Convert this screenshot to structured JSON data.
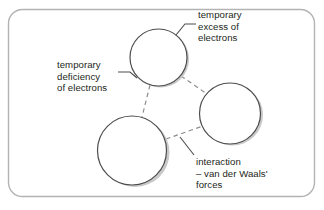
{
  "figure": {
    "frame": {
      "border_color": "#b3b3b3",
      "fill_color": "#ffffff",
      "corner_radius": 14
    },
    "colors": {
      "circle_outline": "#4d4d4d",
      "circle_shading": "#c9c9c9",
      "circle_fill": "#ffffff",
      "dashed_line": "#8c8c8c",
      "leader_line": "#4d4d4d",
      "text": "#231f20"
    },
    "atoms": [
      {
        "name": "top-atom",
        "cx": 159,
        "cy": 58,
        "r": 29
      },
      {
        "name": "bottom-left-atom",
        "cx": 133,
        "cy": 151,
        "r": 35
      },
      {
        "name": "right-atom",
        "cx": 231,
        "cy": 114,
        "r": 31
      }
    ],
    "labels": {
      "excess": {
        "name": "temporary-excess-of-electrons",
        "lines": [
          "temporary",
          "excess of",
          "electrons"
        ],
        "line1": "temporary",
        "line2": "excess of",
        "line3": "electrons"
      },
      "deficiency": {
        "name": "temporary-deficiency-of-electrons",
        "lines": [
          "temporary",
          "deficiency",
          "of electrons"
        ],
        "line1": "temporary",
        "line2": "deficiency",
        "line3": "of electrons"
      },
      "interaction": {
        "name": "interaction-van-der-waals-forces",
        "lines": [
          "interaction",
          "– van der Waals'",
          "forces"
        ],
        "line1": "interaction",
        "line2": "– van der Waals'",
        "line3": "forces"
      }
    }
  }
}
